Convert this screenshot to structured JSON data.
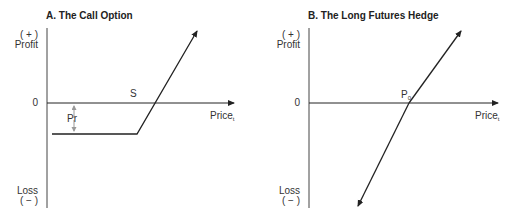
{
  "panels": [
    {
      "id": "A",
      "title": "A.  The Call Option",
      "y_top_label": "( + )",
      "y_top_label2": "Profit",
      "y_zero_label": "0",
      "y_bottom_label": "Loss",
      "y_bottom_label2": "( − )",
      "x_label": "Price",
      "x_label_sub": "t",
      "strike_label": "S",
      "premium_label": "Pr"
    },
    {
      "id": "B",
      "title": "B.  The Long Futures Hedge",
      "y_top_label": "( + )",
      "y_top_label2": "Profit",
      "y_zero_label": "0",
      "y_bottom_label": "Loss",
      "y_bottom_label2": "( − )",
      "x_label": "Price",
      "x_label_sub": "t",
      "intercept_label": "P",
      "intercept_label_sub": "0"
    }
  ],
  "colors": {
    "line": "#222222",
    "premium_arrow": "#999999"
  }
}
